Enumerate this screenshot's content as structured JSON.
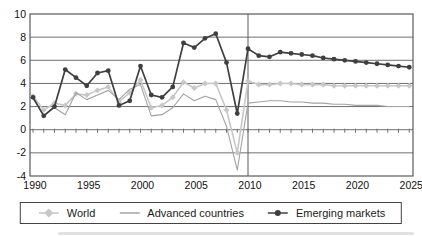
{
  "chart_data": {
    "type": "line",
    "title": "",
    "xlabel": "",
    "ylabel": "",
    "x_start": 1990,
    "x_end": 2025,
    "x_tick_years": [
      1990,
      1995,
      2000,
      2005,
      2010,
      2015,
      2020,
      2025
    ],
    "x_tick_labels": [
      "1990",
      "1995",
      "2000",
      "2005",
      "2010",
      "2015",
      "2020",
      "2025"
    ],
    "y_ticks": [
      10,
      8,
      6,
      4,
      2,
      0,
      -2,
      -4
    ],
    "ylim": [
      -4,
      10
    ],
    "grid": "horizontal",
    "forecast_divider_year": 2010,
    "legend_position": "bottom",
    "axis_color": "#5a5a5a",
    "grid_color": "#6f6f6f",
    "text_color": "#111111",
    "years": [
      1990,
      1991,
      1992,
      1993,
      1994,
      1995,
      1996,
      1997,
      1998,
      1999,
      2000,
      2001,
      2002,
      2003,
      2004,
      2005,
      2006,
      2007,
      2008,
      2009,
      2010,
      2011,
      2012,
      2013,
      2014,
      2015,
      2016,
      2017,
      2018,
      2019,
      2020,
      2021,
      2022,
      2023,
      2024,
      2025
    ],
    "series": [
      {
        "name": "World",
        "color": "#c7c7c7",
        "marker": "diamond",
        "line_width": 1.6,
        "values": [
          2.9,
          1.7,
          2.3,
          2.1,
          3.1,
          3.0,
          3.4,
          3.7,
          2.4,
          3.2,
          4.3,
          1.9,
          2.1,
          2.8,
          4.1,
          3.6,
          4.0,
          4.0,
          1.7,
          -2.0,
          4.2,
          3.9,
          3.9,
          4.0,
          4.0,
          3.9,
          3.9,
          3.9,
          3.8,
          3.8,
          3.8,
          3.8,
          3.8,
          3.8,
          3.8,
          3.8
        ]
      },
      {
        "name": "Advanced countries",
        "color": "#a3a3a3",
        "marker": "none",
        "line_width": 1.1,
        "values": [
          2.7,
          1.2,
          1.9,
          1.3,
          3.2,
          2.6,
          3.0,
          3.4,
          2.6,
          3.5,
          3.9,
          1.2,
          1.3,
          1.9,
          3.1,
          2.5,
          2.9,
          2.6,
          0.3,
          -3.5,
          2.3,
          2.4,
          2.5,
          2.5,
          2.4,
          2.4,
          2.3,
          2.3,
          2.2,
          2.2,
          2.1,
          2.1,
          2.1,
          2.0,
          2.0,
          2.0
        ]
      },
      {
        "name": "Emerging markets",
        "color": "#3f3f3f",
        "marker": "circle",
        "line_width": 1.7,
        "values": [
          2.8,
          1.2,
          2.0,
          5.2,
          4.5,
          3.8,
          4.9,
          5.1,
          2.1,
          2.5,
          5.5,
          3.0,
          2.8,
          3.7,
          7.5,
          7.1,
          7.9,
          8.3,
          5.8,
          1.4,
          7.0,
          6.4,
          6.3,
          6.7,
          6.6,
          6.5,
          6.4,
          6.2,
          6.1,
          6.0,
          5.9,
          5.8,
          5.7,
          5.6,
          5.5,
          5.4
        ]
      }
    ]
  }
}
